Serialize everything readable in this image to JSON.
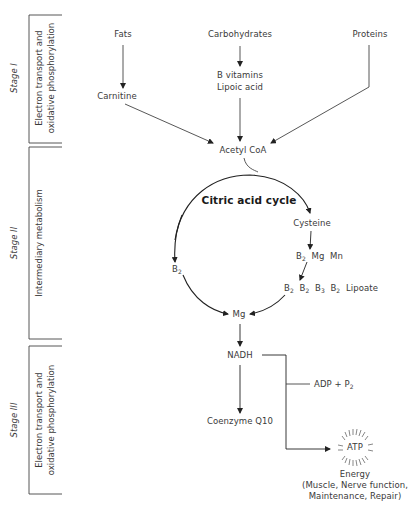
{
  "stages": [
    {
      "name": "Stage I",
      "description_lines": [
        "Electron transport and",
        "oxidative phosphorylation"
      ]
    },
    {
      "name": "Stage II",
      "description_lines": [
        "Intermediary metabolism"
      ]
    },
    {
      "name": "Stage III",
      "description_lines": [
        "Electron transport and",
        "oxidative phosphorylation"
      ]
    }
  ],
  "nodes": {
    "fats": "Fats",
    "carbohydrates": "Carbohydrates",
    "proteins": "Proteins",
    "carnitine": "Carnitine",
    "b_vitamins": "B vitamins",
    "lipoic_acid": "Lipoic acid",
    "acetyl_coa": "Acetyl CoA",
    "cycle_title": "Citric acid cycle",
    "cysteine": "Cysteine",
    "b2_mg_mn": {
      "b": "B",
      "b_sub": "2",
      "mg": "Mg",
      "mn": "Mn"
    },
    "b_row": {
      "b": "B",
      "subs": [
        "2",
        "2",
        "3",
        "2"
      ],
      "lipoate": "Lipoate"
    },
    "left_b": {
      "b": "B",
      "sub": "2"
    },
    "mg": "Mg",
    "nadh": "NADH",
    "adp": {
      "text": "ADP + P",
      "sub": "2"
    },
    "coenzyme": "Coenzyme Q10",
    "atp": "ATP",
    "energy": "Energy",
    "energy_detail_1": "(Muscle, Nerve function,",
    "energy_detail_2": "Maintenance, Repair)"
  }
}
